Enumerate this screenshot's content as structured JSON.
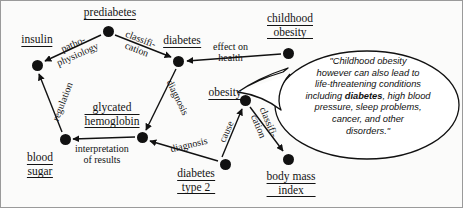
{
  "diagram": {
    "type": "concept-map",
    "nodes": [
      {
        "id": "insulin",
        "label": "insulin",
        "lines": [
          "insulin"
        ],
        "x": 37,
        "y": 65
      },
      {
        "id": "prediabetes",
        "label": "prediabetes",
        "lines": [
          "prediabetes"
        ],
        "x": 108,
        "y": 31
      },
      {
        "id": "diabetes",
        "label": "diabetes",
        "lines": [
          "diabetes"
        ],
        "x": 178,
        "y": 61
      },
      {
        "id": "childhood-obesity",
        "label": "childhood obesity",
        "lines": [
          "childhood",
          "obesity"
        ],
        "x": 288,
        "y": 53
      },
      {
        "id": "obesity",
        "label": "obesity",
        "lines": [
          "obesity"
        ],
        "x": 245,
        "y": 100
      },
      {
        "id": "glycated-hemoglobin",
        "label": "glycated hemoglobin",
        "lines": [
          "glycated",
          "hemoglobin"
        ],
        "x": 142,
        "y": 137
      },
      {
        "id": "blood-sugar",
        "label": "blood sugar",
        "lines": [
          "blood",
          "sugar"
        ],
        "x": 65,
        "y": 139
      },
      {
        "id": "diabetes-type-2",
        "label": "diabetes type 2",
        "lines": [
          "diabetes",
          "type 2"
        ],
        "x": 225,
        "y": 164
      },
      {
        "id": "body-mass-index",
        "label": "body mass index",
        "lines": [
          "body mass",
          "index"
        ],
        "x": 288,
        "y": 159
      }
    ],
    "edges": [
      {
        "id": "e-patho",
        "from": "prediabetes",
        "to": "insulin",
        "label": "pathophysiology",
        "lines": [
          "patho-",
          "physiology"
        ]
      },
      {
        "id": "e-classif-1",
        "from": "prediabetes",
        "to": "diabetes",
        "label": "classification",
        "lines": [
          "classifi-",
          "cation"
        ]
      },
      {
        "id": "e-effect",
        "from": "childhood-obesity",
        "to": "diabetes",
        "label": "effect on health",
        "lines": [
          "effect on",
          "health"
        ]
      },
      {
        "id": "e-diagnosis-1",
        "from": "diabetes",
        "to": "glycated-hemoglobin",
        "label": "diagnosis",
        "lines": [
          "diagnosis"
        ]
      },
      {
        "id": "e-regulation",
        "from": "blood-sugar",
        "to": "insulin",
        "label": "regulation",
        "lines": [
          "regulation"
        ]
      },
      {
        "id": "e-interp",
        "from": "glycated-hemoglobin",
        "to": "blood-sugar",
        "label": "interpretation of results",
        "lines": [
          "interpretation",
          "of results"
        ]
      },
      {
        "id": "e-diagnosis-2",
        "from": "diabetes-type-2",
        "to": "glycated-hemoglobin",
        "label": "diagnosis",
        "lines": [
          "diagnosis"
        ]
      },
      {
        "id": "e-cause",
        "from": "diabetes-type-2",
        "to": "obesity",
        "label": "cause",
        "lines": [
          "cause"
        ]
      },
      {
        "id": "e-classif-2",
        "from": "obesity",
        "to": "body-mass-index",
        "label": "classification",
        "lines": [
          "classifi-",
          "cation"
        ]
      }
    ],
    "annotation": {
      "id": "childhood-obesity-callout",
      "anchor": "childhood-obesity",
      "shape": "speech-bubble-ellipse",
      "text_full": "\"Childhood obesity however can also lead to life-threatening conditions including diabetes, high blood pressure, sleep problems, cancer, and other disorders.\"",
      "lines": [
        "\"Childhood obesity",
        "however can also lead to",
        "life-threatening conditions",
        "including |diabetes|, high blood",
        "pressure, sleep problems,",
        "cancer, and other",
        "disorders.\""
      ],
      "emphasis_word": "diabetes"
    },
    "colors": {
      "ink": "#131313",
      "node_fill": "#111111",
      "background": "#fbfbfa",
      "border": "#8a8a8a"
    }
  }
}
